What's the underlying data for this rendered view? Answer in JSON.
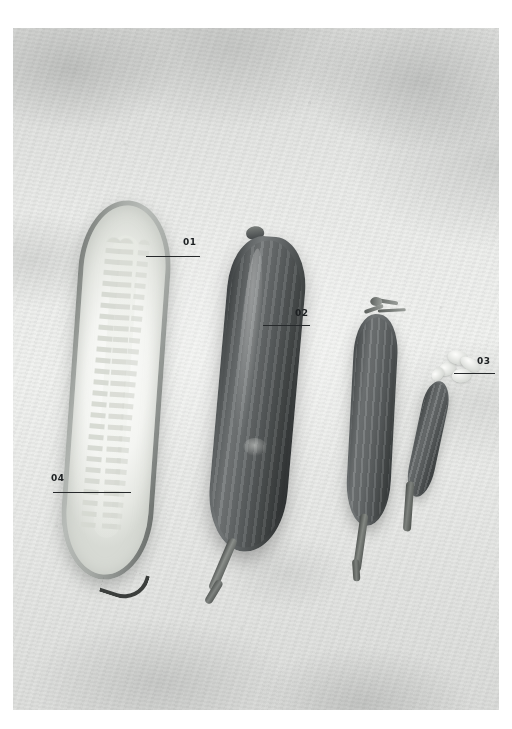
{
  "figure": {
    "type": "annotated-photograph",
    "palette": {
      "page_background": "#ffffff",
      "plate_background": "#e9eae8",
      "label_text": "#1d2022",
      "leader_line": "#26292b"
    },
    "plate": {
      "x": 13,
      "y": 28,
      "width": 486,
      "height": 682,
      "surface": "mottled light gray plaster / concrete backdrop",
      "color_mode": "grayscale"
    }
  },
  "specimens": [
    {
      "id": "specimen-halved-cucumber",
      "name": "Halved cucumber, cut face up",
      "position": "far left",
      "features": "pale flesh with rows of seeds, dark green skin rim, dark dried stalk at base"
    },
    {
      "id": "specimen-whole-cucumber",
      "name": "Whole dark cucumber",
      "position": "centre left",
      "features": "ridged dark skin, long curved stem"
    },
    {
      "id": "specimen-medium-cucumber",
      "name": "Medium small cucumber",
      "position": "centre right",
      "features": "ridged skin, withered flower crown at tip, curved stem"
    },
    {
      "id": "specimen-baby-cucumber",
      "name": "Baby cucumber with attached flower",
      "position": "far right",
      "features": "smallest fruit, pale dried blossom still attached"
    }
  ],
  "callouts": [
    {
      "id": "callout-01",
      "label": "01",
      "target": "specimen-halved-cucumber",
      "points_to": "cut flesh surface"
    },
    {
      "id": "callout-02",
      "label": "02",
      "target": "specimen-whole-cucumber",
      "points_to": "ridged skin"
    },
    {
      "id": "callout-03",
      "label": "03",
      "target": "specimen-baby-cucumber",
      "points_to": "attached dried flower"
    },
    {
      "id": "callout-04",
      "label": "04",
      "target": "specimen-halved-cucumber",
      "points_to": "seed cavity rows"
    }
  ]
}
